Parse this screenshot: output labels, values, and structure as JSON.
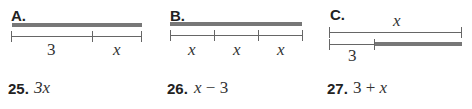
{
  "diagrams": [
    {
      "label": "A.",
      "segments": [
        "3",
        "x"
      ]
    },
    {
      "label": "B.",
      "segments": [
        "x",
        "x",
        "x"
      ]
    },
    {
      "label": "C.",
      "top_label": "x",
      "bottom_label": "3"
    }
  ],
  "exercises": [
    {
      "number": "25.",
      "expression": "3x"
    },
    {
      "number": "26.",
      "expression": "x − 3"
    },
    {
      "number": "27.",
      "expression": "3 + x"
    }
  ]
}
